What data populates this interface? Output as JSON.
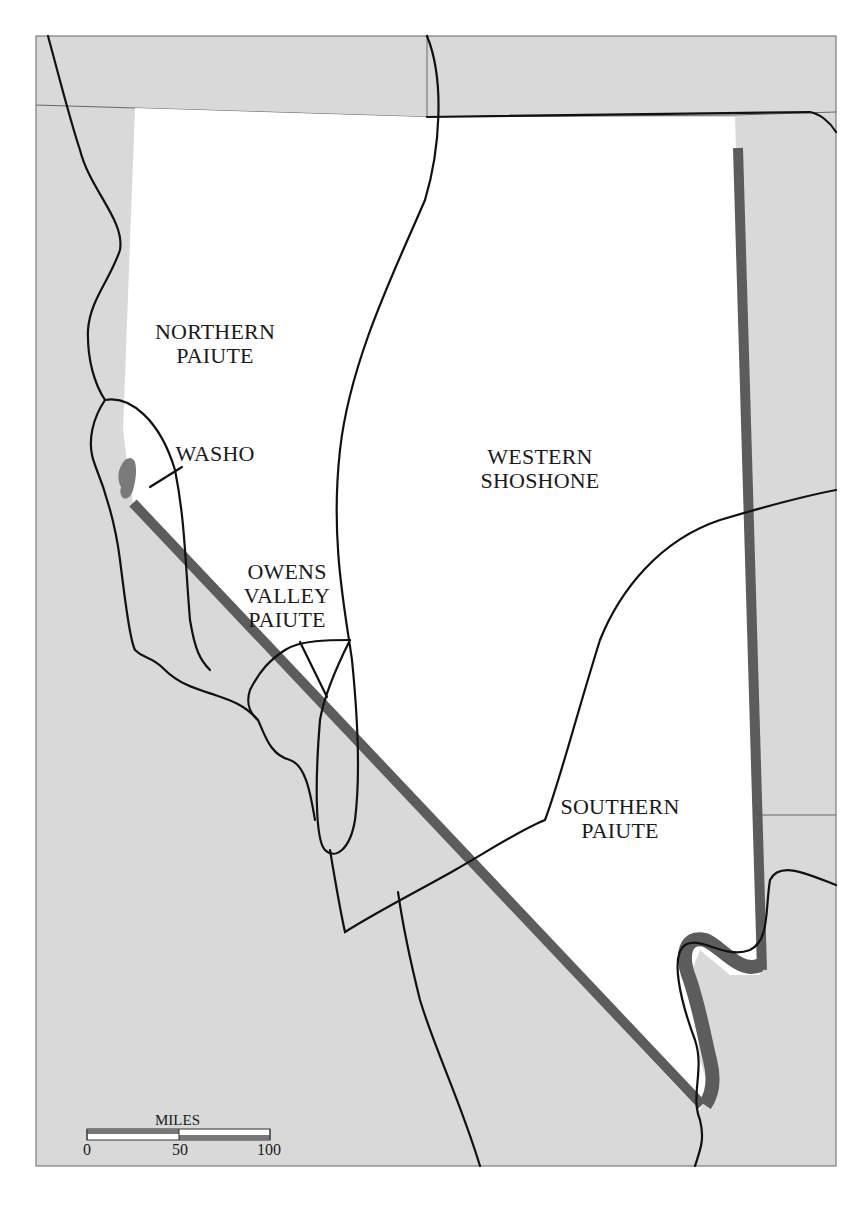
{
  "map": {
    "title": "",
    "colors": {
      "outside": "#d9d9d9",
      "region": "#ffffff",
      "boundary_line": "#111111",
      "state_border": "#5c5c5c",
      "lake": "#7a7a7a",
      "frame": "#666666"
    },
    "regions": [
      {
        "id": "northern-paiute",
        "label": "NORTHERN\nPAIUTE"
      },
      {
        "id": "washo",
        "label": "WASHO"
      },
      {
        "id": "western-shoshone",
        "label": "WESTERN\nSHOSHONE"
      },
      {
        "id": "owens-valley-paiute",
        "label": "OWENS\nVALLEY\nPAIUTE"
      },
      {
        "id": "southern-paiute",
        "label": "SOUTHERN\nPAIUTE"
      }
    ],
    "scale_bar": {
      "unit_label": "MILES",
      "ticks": [
        "0",
        "50",
        "100"
      ]
    }
  }
}
